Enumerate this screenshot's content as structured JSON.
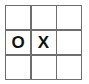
{
  "board": {
    "title": "Tic-Tac-Toe Board",
    "rows": 3,
    "columns": 3,
    "grid_line_color": "#6e6e6e",
    "cell_background": "#ffffff",
    "mark_color": "#111111",
    "page_background": "#ffffff",
    "cells": [
      {
        "id": "cell-r1c1",
        "row": 1,
        "column": 1,
        "mark": ""
      },
      {
        "id": "cell-r1c2",
        "row": 1,
        "column": 2,
        "mark": ""
      },
      {
        "id": "cell-r1c3",
        "row": 1,
        "column": 3,
        "mark": ""
      },
      {
        "id": "cell-r2c1",
        "row": 2,
        "column": 1,
        "mark": "O"
      },
      {
        "id": "cell-r2c2",
        "row": 2,
        "column": 2,
        "mark": "X"
      },
      {
        "id": "cell-r2c3",
        "row": 2,
        "column": 3,
        "mark": ""
      },
      {
        "id": "cell-r3c1",
        "row": 3,
        "column": 1,
        "mark": ""
      },
      {
        "id": "cell-r3c2",
        "row": 3,
        "column": 2,
        "mark": ""
      },
      {
        "id": "cell-r3c3",
        "row": 3,
        "column": 3,
        "mark": ""
      }
    ]
  }
}
